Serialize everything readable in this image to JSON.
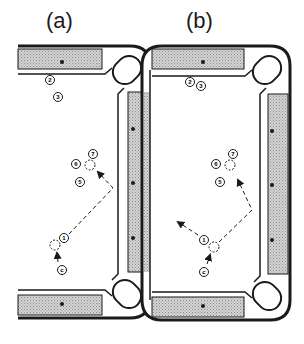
{
  "figure": {
    "panels": [
      {
        "id": "a",
        "label": "(a)"
      },
      {
        "id": "b",
        "label": "(b)"
      }
    ],
    "balls": {
      "two": "2",
      "three": "3",
      "five": "5",
      "six": "6",
      "seven": "7",
      "one": "1",
      "cue": "c"
    },
    "colors": {
      "line": "#1a1a1a",
      "rail_fill": "#bdbdbd",
      "background": "#ffffff"
    }
  }
}
